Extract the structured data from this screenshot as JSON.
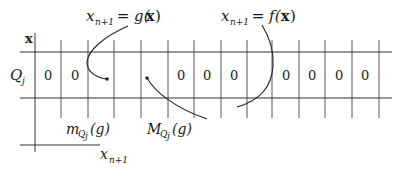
{
  "diagram": {
    "axis_labels": {
      "vertical": "x",
      "horizontal_var": "x",
      "horizontal_sub": "n+1",
      "row_label_main": "Q",
      "row_label_sub": "j"
    },
    "annotations": {
      "g_label": {
        "var": "x",
        "sub": "n+1",
        "rest": " = g(",
        "arg": "x",
        "close": ")"
      },
      "f_label": {
        "var": "x",
        "sub": "n+1",
        "rest": " = f(",
        "arg": "x",
        "close": ")"
      },
      "min_label": {
        "main": "m",
        "sub1": "Q",
        "sub2": "j",
        "rest": "(g)"
      },
      "max_label": {
        "main": "M",
        "sub1": "Q",
        "sub2": "j",
        "rest": "(g)"
      }
    },
    "cells": [
      "0",
      "0",
      "",
      "",
      "",
      "0",
      "0",
      "0",
      "",
      "",
      "0",
      "0",
      "0",
      "0"
    ],
    "zero_values": {
      "c0": "0",
      "c1": "0",
      "c5": "0",
      "c6": "0",
      "c7": "0",
      "c10": "0",
      "c11": "0",
      "c12": "0",
      "c13": "0"
    },
    "line_color": "#333333"
  }
}
